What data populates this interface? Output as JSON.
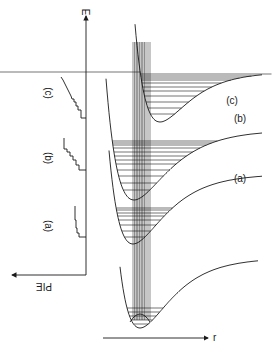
{
  "diagram": {
    "energy_axis_label": "E",
    "distance_axis_label": "r",
    "spectrum_axis_label": "PIE",
    "curves": [
      {
        "id": "ground",
        "label": ""
      },
      {
        "id": "a",
        "label": "(a)"
      },
      {
        "id": "b",
        "label": "(b)"
      },
      {
        "id": "c",
        "label": "(c)"
      }
    ],
    "spectra": [
      {
        "id": "a",
        "label": "(a)"
      },
      {
        "id": "b",
        "label": "(b)"
      },
      {
        "id": "c",
        "label": "(c)"
      }
    ]
  }
}
